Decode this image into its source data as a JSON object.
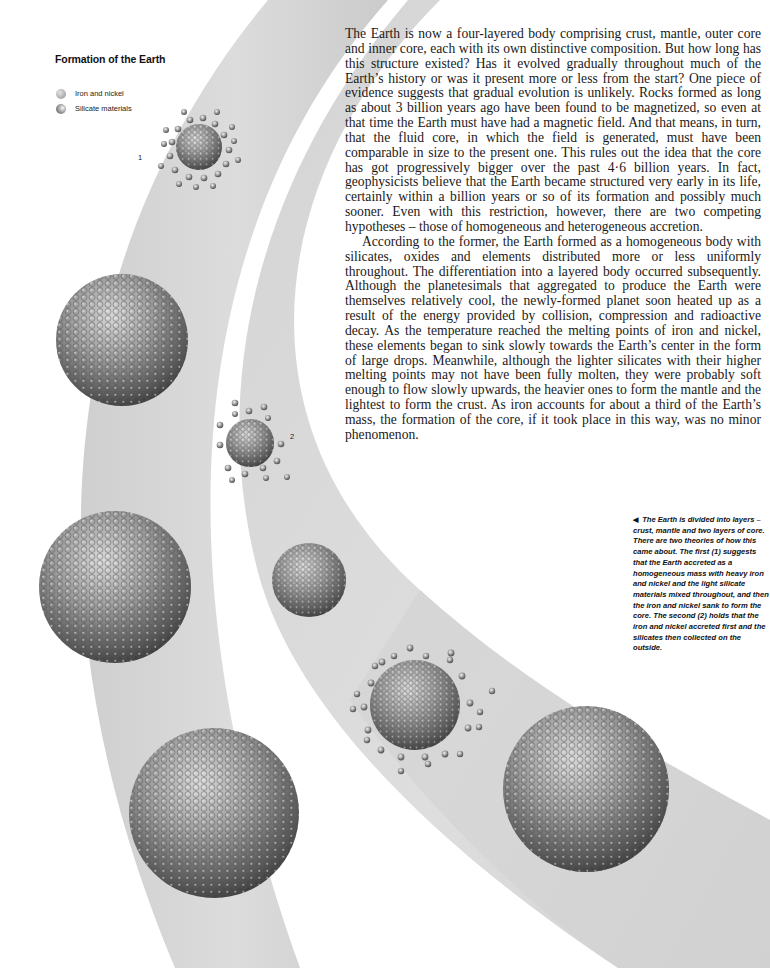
{
  "figure": {
    "title": "Formation of the Earth",
    "legend": [
      {
        "icon": "iron-nickel-sphere-icon",
        "label": "Iron and nickel"
      },
      {
        "icon": "silicate-sphere-icon",
        "label": "Silicate materials"
      }
    ],
    "sequence_labels": {
      "one": "1",
      "two": "2"
    },
    "caption_arrow": "◀",
    "caption": "The Earth is divided into layers – crust, mantle and two layers of core. There are two theories of how this came about. The first (1) suggests that the Earth accreted as a homogeneous mass with heavy iron and nickel and the light silicate materials mixed throughout, and then the iron and nickel sank to form the core. The second (2) holds that the iron and nickel accreted first and the silicates then collected on the outside."
  },
  "article": {
    "paragraphs": [
      "The Earth is now a four-layered body comprising crust, mantle, outer core and inner core, each with its own distinctive composition. But how long has this structure existed? Has it evolved gradually through­out much of the Earth’s history or was it present more or less from the start? One piece of evidence suggests that gradual evolution is unlikely. Rocks formed as long as about 3 billion years ago have been found to be magnetized, so even at that time the Earth must have had a magnetic field. And that means, in turn, that the fluid core, in which the field is generated, must have been comparable in size to the present one. This rules out the idea that the core has got progressively bigger over the past 4·6 billion years. In fact, geophysicists believe that the Earth became structured very early in its life, certainly within a billion years or so of its formation and possibly much sooner. Even with this restriction, however, there are two competing hypotheses – those of homogeneous and heterogeneous accretion.",
      "According to the former, the Earth formed as a homogeneous body with silicates, oxides and elements distributed more or less uniformly throughout. The differentiation into a layered body occurred sub­sequently. Although the planetesimals that aggregated to produce the Earth were themselves relatively cool, the newly-formed planet soon heated up as a result of the energy provided by collision, compression and radioactive decay. As the temperature reached the melting points of iron and nickel, these elements began to sink slowly towards the Earth’s center in the form of large drops. Meanwhile, although the lighter silicates with their higher melting points may not have been fully molten, they were probably soft enough to flow slowly upwards, the heavier ones to form the mantle and the lightest to form the crust. As iron accounts for about a third of the Earth’s mass, the formation of the core, if it took place in this way, was no minor phenomenon."
    ]
  },
  "colors": {
    "page": "#ffffff",
    "band": "#d6d6d6",
    "band_shadow": "#c4c4c4",
    "text": "#1a1a1a",
    "sphere_dark": "#4a4a4a",
    "sphere_light": "#cfcfcf"
  }
}
